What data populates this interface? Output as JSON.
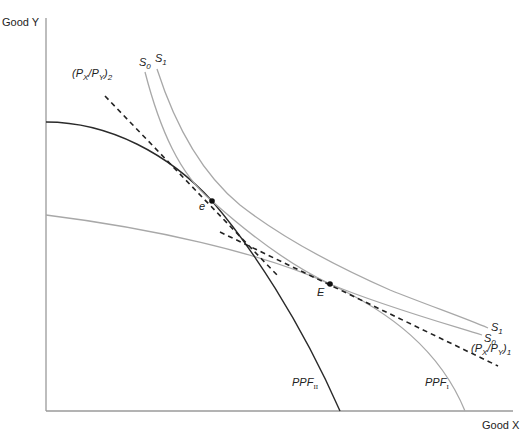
{
  "diagram": {
    "type": "economics-ppf-indifference",
    "axes": {
      "y_label": "Good Y",
      "x_label": "Good X"
    },
    "curves": {
      "ppf_ii": {
        "label_main": "PPF",
        "label_sub": "II",
        "color": "#2a2a2a"
      },
      "ppf_i": {
        "label_main": "PPF",
        "label_sub": "I",
        "color": "#a8a8a8"
      },
      "s0": {
        "label_main": "S",
        "label_sub": "0",
        "color": "#a8a8a8"
      },
      "s1": {
        "label_main": "S",
        "label_sub": "1",
        "color": "#a8a8a8"
      }
    },
    "price_lines": {
      "p2": {
        "open": "(P",
        "x": "X",
        "slash": "/P",
        "y": "Y",
        "close": ")",
        "sub": "2",
        "color": "#222222"
      },
      "p1": {
        "open": "(P",
        "x": "X",
        "slash": "/P",
        "y": "Y",
        "close": ")",
        "sub": "1",
        "color": "#222222"
      }
    },
    "points": {
      "e": {
        "label": "e"
      },
      "E": {
        "label": "E"
      }
    }
  }
}
